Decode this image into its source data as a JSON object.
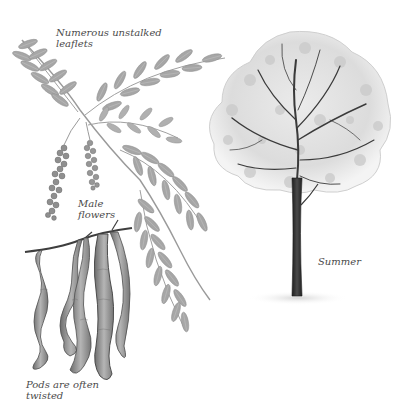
{
  "illustration": {
    "subject": "Botanical plate: compound leaf, male flower catkins, twisted seed pods and tree in summer",
    "palette": {
      "background": "#ffffff",
      "leaf": "#a9a9a9",
      "leaf_dark": "#8a8a8a",
      "pod": "#9a9a9a",
      "pod_dark": "#5e5e5e",
      "trunk": "#2f2f2f",
      "canopy": "#c8c8c8",
      "caption": "#4a4a4a"
    }
  },
  "captions": {
    "leaflets": "Numerous unstalked\nleaflets",
    "male_flowers": "Male\nflowers",
    "pods": "Pods are often\ntwisted",
    "summer": "Summer"
  }
}
